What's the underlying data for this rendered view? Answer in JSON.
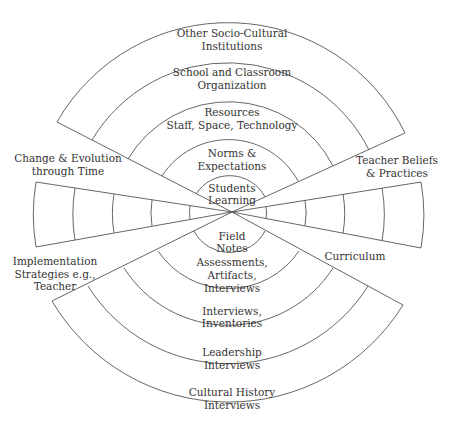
{
  "diagram": {
    "type": "concentric-wedge-diagram",
    "colors": {
      "line": "#555555",
      "text": "#333333",
      "background": "#ffffff"
    },
    "top_wedge": {
      "rings": [
        {
          "line1": "Students",
          "line2": "Learning"
        },
        {
          "line1": "Norms &",
          "line2": "Expectations"
        },
        {
          "line1": "Resources",
          "line2": "Staff, Space, Technology"
        },
        {
          "line1": "School and Classroom",
          "line2": "Organization"
        },
        {
          "line1": "Other Socio-Cultural",
          "line2": "Institutions"
        }
      ]
    },
    "bottom_wedge": {
      "rings": [
        {
          "line1": "Field",
          "line2": "Notes"
        },
        {
          "line1": "Assessments,",
          "line2": "Artifacts,",
          "line3": "Interviews"
        },
        {
          "line1": "Interviews,",
          "line2": "Inventories"
        },
        {
          "line1": "Leadership",
          "line2": "Interviews"
        },
        {
          "line1": "Cultural History",
          "line2": "Interviews"
        }
      ]
    },
    "side_labels": {
      "upper_left": {
        "line1": "Change & Evolution",
        "line2": "through Time"
      },
      "upper_right": {
        "line1": "Teacher Beliefs",
        "line2": "& Practices"
      },
      "lower_left": {
        "line1": "Implementation",
        "line2": "Strategies e.g.,",
        "line3": "Teacher"
      },
      "lower_right": {
        "line1": "Curriculum"
      }
    },
    "left_wedge": {
      "segments": 5
    },
    "right_wedge": {
      "segments": 5
    }
  }
}
